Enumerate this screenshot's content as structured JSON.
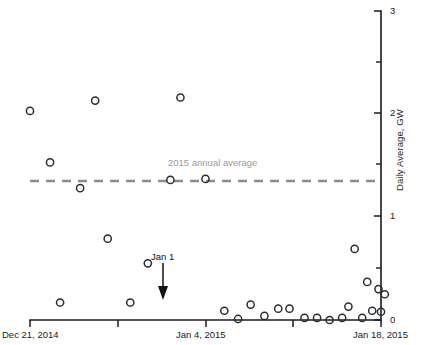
{
  "chart_data": {
    "type": "scatter",
    "title": "",
    "xlabel": "",
    "ylabel": "Daily Average, GW",
    "ylim": [
      0,
      3
    ],
    "yticks": [
      0,
      1,
      2,
      3
    ],
    "yticklabels": [
      "0",
      "1",
      "2",
      "3"
    ],
    "yminorticks": [
      0.5,
      1.5,
      2.5
    ],
    "xlim": [
      "Dec 21, 2014",
      "Jan 18, 2015"
    ],
    "xticklabels": [
      "Dec 21, 2014",
      "Jan 4, 2015",
      "Jan 18, 2015"
    ],
    "xtick_days": [
      0,
      14,
      28
    ],
    "grid": false,
    "legend": "none",
    "series": [
      {
        "name": "Daily Average, GW",
        "marker": "open-circle",
        "x_days": [
          0,
          2,
          4,
          6,
          8,
          10,
          12,
          14,
          16,
          18,
          20,
          22,
          24,
          26,
          27,
          28,
          1,
          3,
          5,
          7,
          9,
          11,
          13,
          15,
          17,
          19,
          21,
          23,
          25
        ],
        "points": [
          {
            "day": 0,
            "date": "Dec 21, 2014",
            "value": 2.03
          },
          {
            "day": 1.6,
            "date": "Dec 22, 2014",
            "value": 1.53
          },
          {
            "day": 2.4,
            "date": "Dec 23, 2014",
            "value": 0.17
          },
          {
            "day": 4.0,
            "date": "Dec 24, 2014",
            "value": 1.28
          },
          {
            "day": 5.2,
            "date": "Dec 25, 2014",
            "value": 2.13
          },
          {
            "day": 6.2,
            "date": "Dec 26, 2014",
            "value": 0.79
          },
          {
            "day": 8.0,
            "date": "Dec 27, 2014",
            "value": 0.17
          },
          {
            "day": 9.4,
            "date": "Dec 28, 2014",
            "value": 0.55
          },
          {
            "day": 11.2,
            "date": "Dec 29, 2014",
            "value": 1.36
          },
          {
            "day": 12.0,
            "date": "Dec 30, 2014",
            "value": 2.16
          },
          {
            "day": 14.0,
            "date": "Dec 31, 2014",
            "value": 1.37
          },
          {
            "day": 15.5,
            "date": "Jan 1, 2015",
            "value": 0.09
          },
          {
            "day": 16.6,
            "date": "Jan 2, 2015",
            "value": 0.01
          },
          {
            "day": 17.6,
            "date": "Jan 3, 2015",
            "value": 0.15
          },
          {
            "day": 18.7,
            "date": "Jan 4, 2015",
            "value": 0.04
          },
          {
            "day": 19.8,
            "date": "Jan 5, 2015",
            "value": 0.11
          },
          {
            "day": 20.7,
            "date": "Jan 6, 2015",
            "value": 0.11
          },
          {
            "day": 21.9,
            "date": "Jan 7, 2015",
            "value": 0.02
          },
          {
            "day": 22.9,
            "date": "Jan 8, 2015",
            "value": 0.02
          },
          {
            "day": 23.9,
            "date": "Jan 9, 2015",
            "value": 0.0
          },
          {
            "day": 24.9,
            "date": "Jan 10, 2015",
            "value": 0.02
          },
          {
            "day": 25.4,
            "date": "Jan 11, 2015",
            "value": 0.13
          },
          {
            "day": 25.9,
            "date": "Jan 12, 2015",
            "value": 0.69
          },
          {
            "day": 26.5,
            "date": "Jan 13, 2015",
            "value": 0.02
          },
          {
            "day": 26.9,
            "date": "Jan 14, 2015",
            "value": 0.37
          },
          {
            "day": 27.3,
            "date": "Jan 15, 2015",
            "value": 0.09
          },
          {
            "day": 27.8,
            "date": "Jan 16, 2015",
            "value": 0.3
          },
          {
            "day": 28.0,
            "date": "Jan 17, 2015",
            "value": 0.08
          },
          {
            "day": 28.3,
            "date": "Jan 18, 2015",
            "value": 0.25
          }
        ]
      }
    ],
    "reference_line": {
      "label": "2015 annual average",
      "value": 1.35,
      "style": "dashed",
      "color": "#8b8b90"
    },
    "annotations": [
      {
        "label": "Jan 1",
        "points_to_day": 15.5,
        "points_to_value": 0.09,
        "arrow": "down"
      }
    ]
  },
  "axes": {
    "y_title": "Daily Average, GW",
    "y_labels": [
      "3",
      "2",
      "1",
      "0"
    ],
    "x_labels": [
      "Dec 21, 2014",
      "Jan 4, 2015",
      "Jan 18, 2015"
    ]
  },
  "reference": {
    "label": "2015 annual average"
  },
  "annotation": {
    "label": "Jan 1"
  },
  "colors": {
    "marker_stroke": "#2b2b35",
    "axis": "#1a1a1a",
    "reference_line": "#8b8b90",
    "reference_label": "#9a9aa0",
    "annotation": "#111111",
    "background": "#ffffff"
  }
}
